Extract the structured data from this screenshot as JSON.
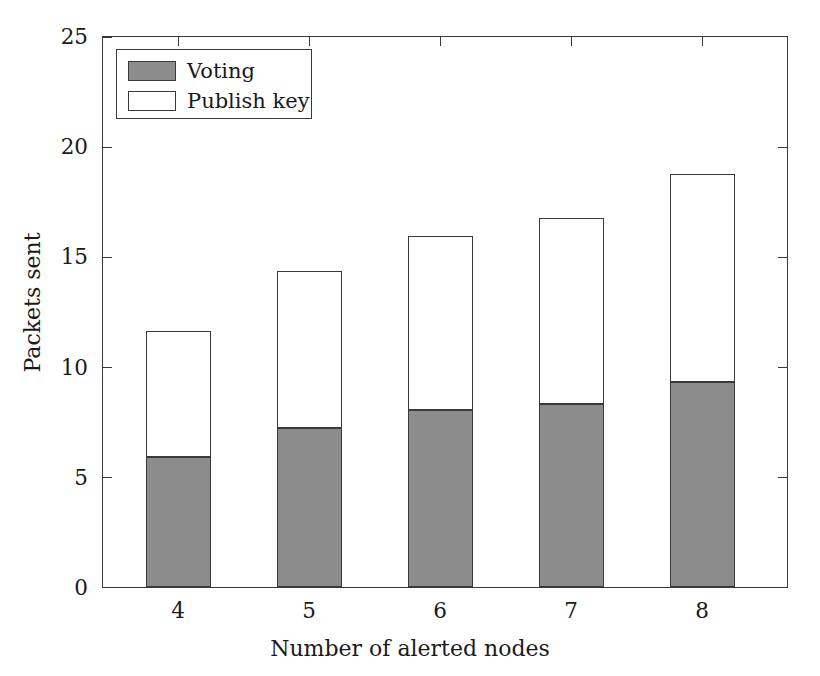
{
  "chart_data": {
    "type": "bar",
    "subtype": "stacked-vertical",
    "title": "",
    "xlabel": "Number of alerted nodes",
    "ylabel": "Packets sent",
    "categories": [
      "4",
      "5",
      "6",
      "7",
      "8"
    ],
    "series": [
      {
        "name": "Voting",
        "color": "#8c8c8c",
        "values": [
          5.9,
          7.2,
          8.0,
          8.3,
          9.3
        ]
      },
      {
        "name": "Publish key",
        "color": "#ffffff",
        "values": [
          5.7,
          7.1,
          7.9,
          8.4,
          9.4
        ]
      }
    ],
    "totals": [
      11.6,
      14.3,
      15.9,
      16.7,
      18.7
    ],
    "ylim": [
      0,
      25
    ],
    "yticks": [
      "0",
      "5",
      "10",
      "15",
      "20",
      "25"
    ],
    "ytick_values": [
      0,
      5,
      10,
      15,
      20,
      25
    ],
    "xticks": [
      "4",
      "5",
      "6",
      "7",
      "8"
    ],
    "grid": false,
    "legend_position": "top-left",
    "legend_entries": [
      "Voting",
      "Publish key"
    ],
    "bar_edge_color": "#3a3a3a",
    "axis_color": "#3a3a3a",
    "background": "#ffffff"
  }
}
